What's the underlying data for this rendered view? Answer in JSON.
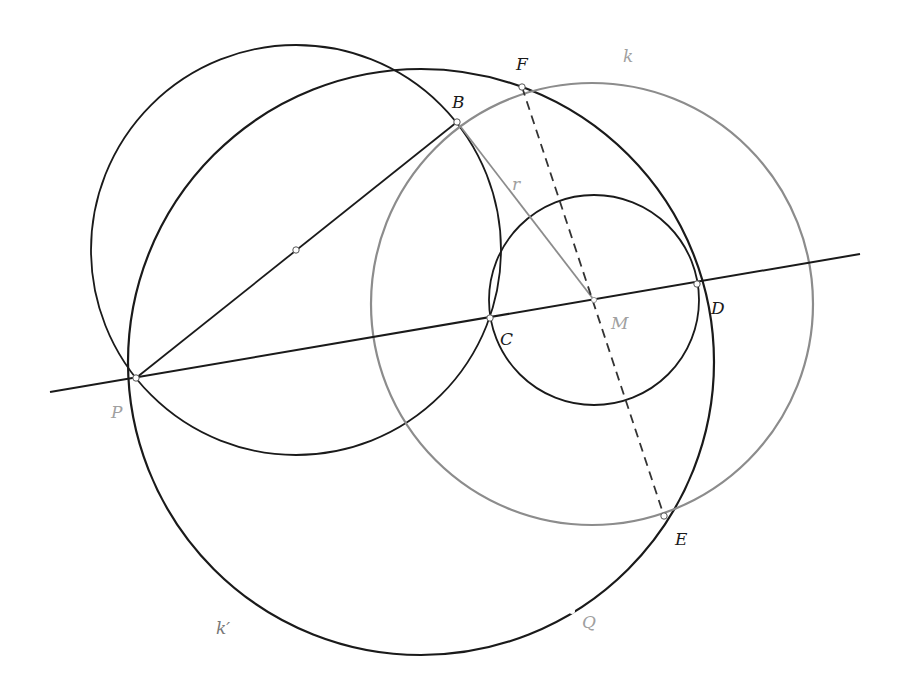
{
  "diagram": {
    "colors": {
      "dark": "#1a1a1a",
      "gray": "#8c8c8c",
      "label_dark": "#1a1a1a",
      "label_gray": "#a0a0a0",
      "point_fill": "#ffffff"
    },
    "points": {
      "P": {
        "label": "P",
        "x": 136,
        "y": 378
      },
      "B": {
        "label": "B",
        "x": 457,
        "y": 122
      },
      "F": {
        "label": "F",
        "x": 522,
        "y": 87
      },
      "C": {
        "label": "C",
        "x": 490,
        "y": 318
      },
      "M": {
        "label": "M",
        "x": 594,
        "y": 300
      },
      "D": {
        "label": "D",
        "x": 697,
        "y": 284
      },
      "E": {
        "label": "E",
        "x": 664,
        "y": 516
      },
      "Q": {
        "label": "Q",
        "x": 572,
        "y": 611
      },
      "mid_PB": {
        "label": "",
        "x": 296,
        "y": 250
      }
    },
    "circles": [
      {
        "name": "circle-PB-diameter",
        "cx": 296,
        "cy": 250,
        "r": 205,
        "color": "dark"
      },
      {
        "name": "circle-k-prime",
        "label": "k′",
        "cx": 421,
        "cy": 362,
        "r": 293,
        "color": "dark"
      },
      {
        "name": "circle-k",
        "label": "k",
        "cx": 592,
        "cy": 304,
        "r": 221,
        "color": "gray"
      },
      {
        "name": "circle-CD",
        "cx": 594,
        "cy": 300,
        "r": 105,
        "color": "dark"
      }
    ],
    "segments": [
      {
        "name": "line-PD",
        "x1": 50,
        "y1": 392,
        "x2": 860,
        "y2": 254,
        "style": "solid",
        "color": "dark"
      },
      {
        "name": "segment-PB",
        "from": "P",
        "to": "B",
        "style": "solid",
        "color": "dark"
      },
      {
        "name": "segment-r",
        "label": "r",
        "from": "B",
        "to": "M",
        "style": "solid",
        "color": "gray"
      },
      {
        "name": "segment-FE",
        "from": "F",
        "to": "E",
        "style": "dashed",
        "color": "dark"
      }
    ],
    "labels": {
      "F": "F",
      "k": "k",
      "B": "B",
      "r": "r",
      "C": "C",
      "M": "M",
      "D": "D",
      "P": "P",
      "E": "E",
      "Q": "Q",
      "k_prime": "k′"
    }
  }
}
